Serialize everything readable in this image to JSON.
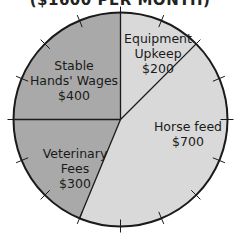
{
  "chart_data": {
    "type": "pie",
    "title": "($1600 PER MONTH)",
    "total": 1600,
    "unit": "$",
    "start_angle_deg": 0,
    "direction": "clockwise",
    "tick_count": 16,
    "tick_value": 100,
    "slices": [
      {
        "label_lines": [
          "Equipment",
          "Upkeep"
        ],
        "label": "Equipment Upkeep",
        "value": 200,
        "value_text": "$200",
        "color": "#d9d9d9"
      },
      {
        "label_lines": [
          "Horse feed"
        ],
        "label": "Horse feed",
        "value": 700,
        "value_text": "$700",
        "color": "#d9d9d9"
      },
      {
        "label_lines": [
          "Veterinary",
          "Fees"
        ],
        "label": "Veterinary Fees",
        "value": 300,
        "value_text": "$300",
        "color": "#a9a9a9"
      },
      {
        "label_lines": [
          "Stable",
          "Hands' Wages"
        ],
        "label": "Stable Hands' Wages",
        "value": 400,
        "value_text": "$400",
        "color": "#a9a9a9"
      }
    ],
    "colors": {
      "outline": "#1a1a1a",
      "light_slice": "#d9d9d9",
      "dark_slice": "#a9a9a9"
    }
  }
}
